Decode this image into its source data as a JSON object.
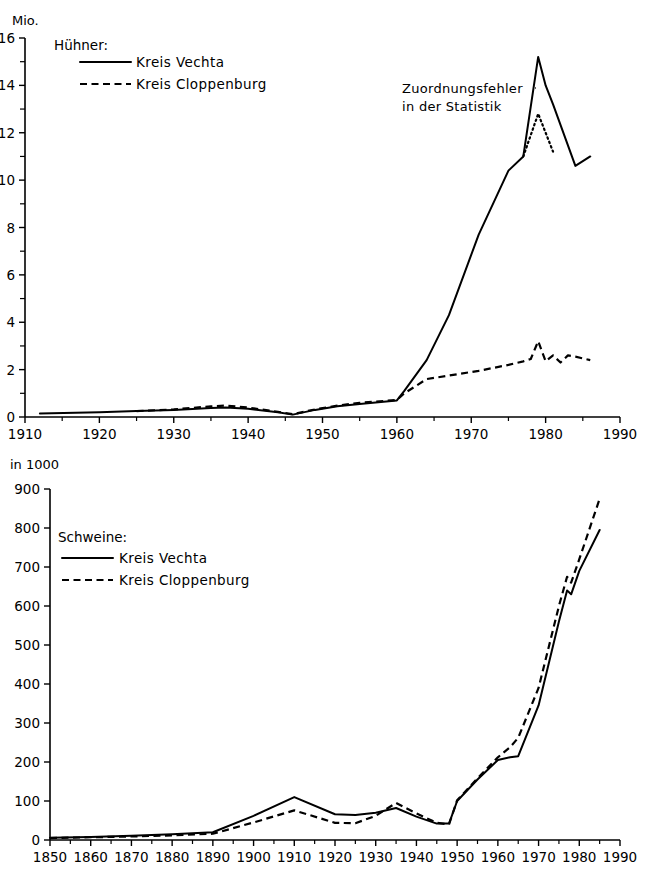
{
  "chart_data": [
    {
      "id": "huehner",
      "type": "line",
      "title": "Hühner:",
      "ylabel": "Mio.",
      "xlabel": "",
      "xlim": [
        1910,
        1990
      ],
      "ylim": [
        0,
        16
      ],
      "xticks": [
        1910,
        1920,
        1930,
        1940,
        1950,
        1960,
        1970,
        1980,
        1990
      ],
      "yticks": [
        0,
        2,
        4,
        6,
        8,
        10,
        12,
        14,
        16
      ],
      "yminor_step": 1,
      "grid": false,
      "legend_position": "top-left",
      "annotations": [
        {
          "text_line1": "Zuordnungsfehler",
          "text_line2": "in der Statistik",
          "points_to_year": 1979
        }
      ],
      "series": [
        {
          "name": "Kreis Vechta",
          "style": "solid",
          "x": [
            1912,
            1920,
            1925,
            1930,
            1935,
            1937,
            1940,
            1944,
            1946,
            1949,
            1952,
            1955,
            1960,
            1961,
            1964,
            1967,
            1971,
            1975,
            1977,
            1979,
            1980,
            1981,
            1984,
            1986
          ],
          "values": [
            0.15,
            0.2,
            0.25,
            0.3,
            0.38,
            0.4,
            0.35,
            0.2,
            0.1,
            0.3,
            0.45,
            0.55,
            0.7,
            1.1,
            2.4,
            4.3,
            7.7,
            10.4,
            11.0,
            15.2,
            14.0,
            13.2,
            10.6,
            11.0
          ]
        },
        {
          "name": "Kreis Cloppenburg",
          "style": "dashed",
          "x": [
            1925,
            1930,
            1935,
            1937,
            1940,
            1944,
            1946,
            1949,
            1952,
            1955,
            1960,
            1961,
            1964,
            1967,
            1971,
            1975,
            1977,
            1978,
            1979,
            1980,
            1981,
            1982,
            1983,
            1984,
            1986
          ],
          "values": [
            0.25,
            0.32,
            0.45,
            0.48,
            0.4,
            0.22,
            0.12,
            0.32,
            0.48,
            0.6,
            0.72,
            1.0,
            1.6,
            1.75,
            1.95,
            2.2,
            2.35,
            2.45,
            3.2,
            2.35,
            2.6,
            2.3,
            2.6,
            2.55,
            2.4
          ]
        },
        {
          "name": "Kreis Vechta (korrigiert)",
          "style": "dotted",
          "x": [
            1977,
            1979,
            1980,
            1981
          ],
          "values": [
            11.0,
            12.8,
            12.0,
            11.2
          ]
        }
      ]
    },
    {
      "id": "schweine",
      "type": "line",
      "title": "Schweine:",
      "ylabel": "in 1000",
      "xlabel": "",
      "xlim": [
        1850,
        1990
      ],
      "ylim": [
        0,
        900
      ],
      "xticks": [
        1850,
        1860,
        1870,
        1880,
        1890,
        1900,
        1910,
        1920,
        1930,
        1940,
        1950,
        1960,
        1970,
        1980,
        1990
      ],
      "yticks": [
        0,
        100,
        200,
        300,
        400,
        500,
        600,
        700,
        800,
        900
      ],
      "grid": false,
      "legend_position": "top-left",
      "series": [
        {
          "name": "Kreis Vechta",
          "style": "solid",
          "x": [
            1850,
            1860,
            1870,
            1880,
            1890,
            1900,
            1910,
            1920,
            1925,
            1930,
            1935,
            1940,
            1945,
            1948,
            1950,
            1955,
            1960,
            1963,
            1965,
            1970,
            1975,
            1977,
            1978,
            1980,
            1985
          ],
          "values": [
            6,
            8,
            11,
            15,
            20,
            62,
            110,
            66,
            64,
            70,
            82,
            60,
            42,
            42,
            100,
            155,
            205,
            212,
            215,
            345,
            560,
            640,
            630,
            690,
            795
          ]
        },
        {
          "name": "Kreis Cloppenburg",
          "style": "dashed",
          "x": [
            1850,
            1860,
            1870,
            1880,
            1890,
            1900,
            1910,
            1920,
            1925,
            1930,
            1935,
            1940,
            1945,
            1948,
            1950,
            1955,
            1960,
            1963,
            1965,
            1970,
            1975,
            1977,
            1978,
            1980,
            1985
          ],
          "values": [
            5,
            7,
            9,
            12,
            16,
            45,
            76,
            44,
            43,
            62,
            95,
            68,
            44,
            40,
            102,
            158,
            212,
            238,
            262,
            390,
            600,
            675,
            660,
            720,
            875
          ]
        }
      ]
    }
  ],
  "legends": {
    "huehner": {
      "title": "Hühner:",
      "entries": [
        {
          "label": "Kreis Vechta",
          "style": "solid"
        },
        {
          "label": "Kreis Cloppenburg",
          "style": "dashed"
        }
      ]
    },
    "schweine": {
      "title": "Schweine:",
      "entries": [
        {
          "label": "Kreis Vechta",
          "style": "solid"
        },
        {
          "label": "Kreis Cloppenburg",
          "style": "dashed"
        }
      ]
    }
  },
  "labels": {
    "top_unit": "Mio.",
    "bottom_unit": "in 1000",
    "annotation_line1": "Zuordnungsfehler",
    "annotation_line2": "in der Statistik"
  }
}
